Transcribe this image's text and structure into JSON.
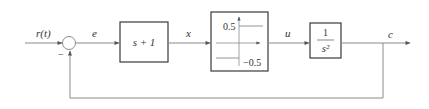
{
  "diagram": {
    "type": "closed-loop control block diagram with relay nonlinearity",
    "signals": {
      "input": "r(t)",
      "error": "e",
      "x": "x",
      "u": "u",
      "output": "c"
    },
    "summing_junction": {
      "feedback_sign": "−"
    },
    "blocks": {
      "controller": {
        "label": "s + 1"
      },
      "relay": {
        "upper_label": "0.5",
        "lower_label": "−0.5"
      },
      "plant": {
        "numerator": "1",
        "denominator": "s²"
      }
    },
    "colors": {
      "line": "#8a8a8a",
      "block_border": "#3a3a3a",
      "text": "#333333"
    }
  }
}
